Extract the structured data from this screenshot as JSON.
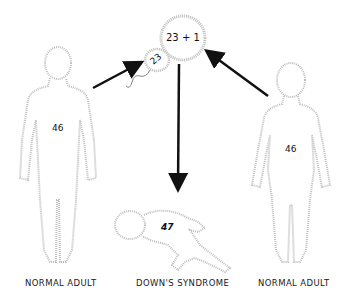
{
  "diagram": {
    "egg_cell": {
      "label": "23 + 1"
    },
    "sperm_cell": {
      "label": "23"
    },
    "figures": [
      {
        "id": "left-adult",
        "chromosomes": "46",
        "caption": "NORMAL ADULT"
      },
      {
        "id": "child",
        "chromosomes": "47",
        "caption": "DOWN'S SYNDROME"
      },
      {
        "id": "right-adult",
        "chromosomes": "46",
        "caption": "NORMAL ADULT"
      }
    ],
    "arrows": [
      {
        "from": "left-adult",
        "to": "sperm-cell"
      },
      {
        "from": "right-adult",
        "to": "egg-cell"
      },
      {
        "from": "egg-cell",
        "to": "child"
      }
    ],
    "colors": {
      "outline": "#b8b8b8",
      "arrow": "#111111",
      "text": "#222222"
    }
  }
}
